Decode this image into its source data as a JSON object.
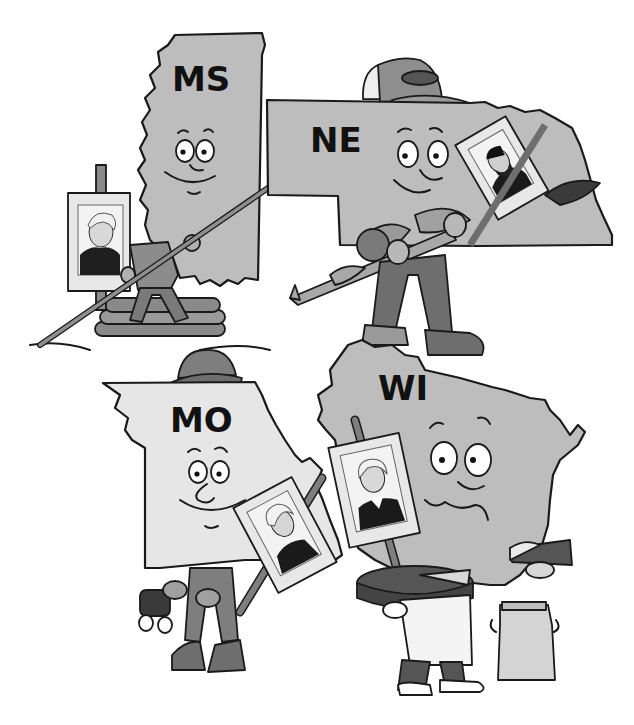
{
  "illustration": {
    "description": "Cartoon of four US states as characters holding portrait signs",
    "colors": {
      "state_gray": "#bdbdbd",
      "state_light": "#e4e4e4",
      "clothing_dark": "#6e6e6e",
      "clothing_mid": "#8c8c8c",
      "ink": "#1a1a1a",
      "background": "#ffffff"
    },
    "states": [
      {
        "abbr": "MS",
        "prop": "pole on log raft",
        "portrait": "man with wavy hair"
      },
      {
        "abbr": "NE",
        "prop": "corn stalks, cap",
        "portrait": "bearded man"
      },
      {
        "abbr": "MO",
        "prop": "binoculars, hat",
        "portrait": "man with curled hair"
      },
      {
        "abbr": "WI",
        "prop": "cheese wheel, milk can",
        "portrait": "man with powdered wig"
      }
    ]
  }
}
